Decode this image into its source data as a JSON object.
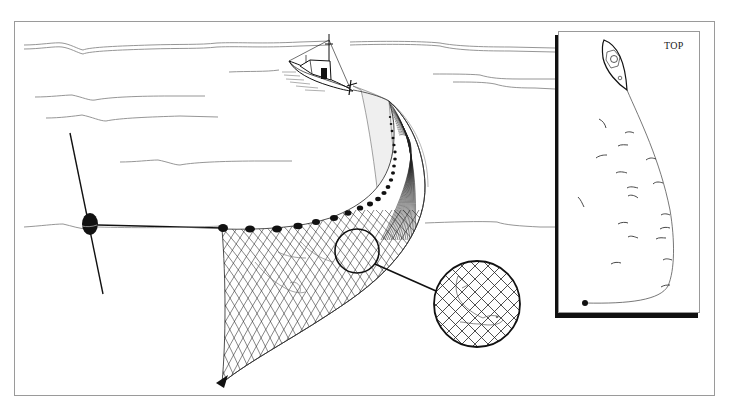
{
  "diagram": {
    "colors": {
      "ink": "#111111",
      "water_line": "#8a8a8a",
      "frame": "#9a9a9a",
      "net_fill": "#efefef",
      "background": "#ffffff"
    },
    "elements": {
      "boat": "fishing-boat",
      "buoy": "marker-buoy",
      "net": "purse-seine-net",
      "float_count": 22,
      "magnifier": "mesh-detail-circle"
    },
    "inset": {
      "label": "TOP",
      "view": "top-view",
      "fish_count": 20
    }
  }
}
